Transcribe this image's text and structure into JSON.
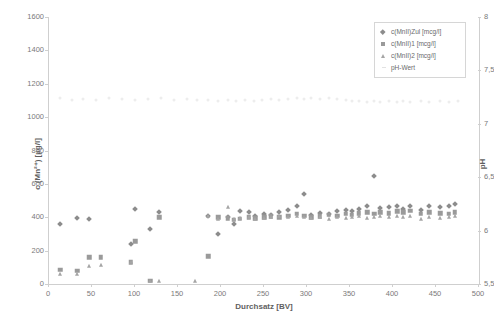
{
  "chart_data": {
    "type": "scatter",
    "title": "",
    "xlabel": "Durchsatz [BV]",
    "ylabel": "c (Mn2+) [µg/l]",
    "y2label": "pH",
    "xlim": [
      0,
      500
    ],
    "ylim": [
      0,
      1600
    ],
    "y2lim": [
      5.5,
      8
    ],
    "grid": false,
    "legend_position": "top-right",
    "xticks": [
      "0",
      "50",
      "100",
      "150",
      "200",
      "250",
      "300",
      "350",
      "400",
      "450",
      "500"
    ],
    "xtick_values": [
      0,
      50,
      100,
      150,
      200,
      250,
      300,
      350,
      400,
      450,
      500
    ],
    "yticks": [
      "0",
      "200",
      "400",
      "600",
      "800",
      "1000",
      "1200",
      "1400",
      "1600"
    ],
    "ytick_values": [
      0,
      200,
      400,
      600,
      800,
      1000,
      1200,
      1400,
      1600
    ],
    "y2ticks": [
      "5,5",
      "6",
      "6,5",
      "7",
      "7,5",
      "8"
    ],
    "y2tick_values": [
      5.5,
      6,
      6.5,
      7,
      7.5,
      8
    ],
    "series": [
      {
        "name": "c(MnII)Zul [mcg/l]",
        "marker": "diamond",
        "color": "#8c8c8c",
        "axis": "left",
        "points": [
          [
            13,
            360
          ],
          [
            33,
            395
          ],
          [
            47,
            390
          ],
          [
            95,
            240
          ],
          [
            100,
            450
          ],
          [
            118,
            330
          ],
          [
            128,
            430
          ],
          [
            185,
            410
          ],
          [
            197,
            300
          ],
          [
            208,
            400
          ],
          [
            215,
            360
          ],
          [
            222,
            440
          ],
          [
            232,
            430
          ],
          [
            240,
            410
          ],
          [
            250,
            420
          ],
          [
            258,
            415
          ],
          [
            268,
            430
          ],
          [
            278,
            445
          ],
          [
            288,
            470
          ],
          [
            297,
            540
          ],
          [
            305,
            415
          ],
          [
            315,
            425
          ],
          [
            325,
            420
          ],
          [
            335,
            435
          ],
          [
            345,
            445
          ],
          [
            352,
            440
          ],
          [
            360,
            450
          ],
          [
            370,
            470
          ],
          [
            378,
            650
          ],
          [
            385,
            455
          ],
          [
            395,
            460
          ],
          [
            405,
            470
          ],
          [
            412,
            450
          ],
          [
            420,
            465
          ],
          [
            432,
            445
          ],
          [
            442,
            470
          ],
          [
            455,
            460
          ],
          [
            465,
            470
          ],
          [
            472,
            480
          ]
        ]
      },
      {
        "name": "c(MnII)1 [mcg/l]",
        "marker": "square",
        "color": "#9a9a9a",
        "axis": "left",
        "points": [
          [
            13,
            85
          ],
          [
            33,
            80
          ],
          [
            47,
            160
          ],
          [
            60,
            160
          ],
          [
            95,
            130
          ],
          [
            100,
            255
          ],
          [
            118,
            20
          ],
          [
            128,
            400
          ],
          [
            185,
            165
          ],
          [
            197,
            400
          ],
          [
            208,
            395
          ],
          [
            215,
            385
          ],
          [
            222,
            390
          ],
          [
            232,
            400
          ],
          [
            240,
            395
          ],
          [
            250,
            400
          ],
          [
            258,
            405
          ],
          [
            268,
            400
          ],
          [
            278,
            410
          ],
          [
            288,
            420
          ],
          [
            297,
            410
          ],
          [
            305,
            400
          ],
          [
            315,
            405
          ],
          [
            325,
            415
          ],
          [
            335,
            410
          ],
          [
            345,
            420
          ],
          [
            352,
            415
          ],
          [
            360,
            425
          ],
          [
            370,
            430
          ],
          [
            378,
            420
          ],
          [
            385,
            430
          ],
          [
            395,
            425
          ],
          [
            405,
            435
          ],
          [
            412,
            430
          ],
          [
            420,
            440
          ],
          [
            432,
            420
          ],
          [
            442,
            430
          ],
          [
            455,
            425
          ],
          [
            465,
            420
          ],
          [
            472,
            430
          ]
        ]
      },
      {
        "name": "c(MnII)2 [mcg/l]",
        "marker": "triangle",
        "color": "#a5a5a5",
        "axis": "left",
        "points": [
          [
            13,
            60
          ],
          [
            33,
            60
          ],
          [
            47,
            110
          ],
          [
            60,
            115
          ],
          [
            95,
            130
          ],
          [
            118,
            15
          ],
          [
            128,
            20
          ],
          [
            170,
            20
          ],
          [
            185,
            405
          ],
          [
            197,
            390
          ],
          [
            208,
            460
          ],
          [
            215,
            390
          ],
          [
            222,
            395
          ],
          [
            232,
            400
          ],
          [
            240,
            390
          ],
          [
            250,
            395
          ],
          [
            258,
            400
          ],
          [
            268,
            405
          ],
          [
            278,
            400
          ],
          [
            288,
            410
          ],
          [
            297,
            400
          ],
          [
            305,
            395
          ],
          [
            315,
            400
          ],
          [
            325,
            390
          ],
          [
            335,
            400
          ],
          [
            345,
            395
          ],
          [
            352,
            400
          ],
          [
            360,
            405
          ],
          [
            370,
            395
          ],
          [
            378,
            400
          ],
          [
            385,
            405
          ],
          [
            395,
            400
          ],
          [
            405,
            410
          ],
          [
            412,
            400
          ],
          [
            420,
            405
          ],
          [
            432,
            390
          ],
          [
            442,
            400
          ],
          [
            455,
            395
          ],
          [
            465,
            400
          ],
          [
            472,
            405
          ]
        ]
      },
      {
        "name": "pH-Wert",
        "marker": "dot",
        "color": "#ededed",
        "axis": "right",
        "points": [
          [
            13,
            7.24
          ],
          [
            27,
            7.22
          ],
          [
            40,
            7.23
          ],
          [
            55,
            7.22
          ],
          [
            70,
            7.24
          ],
          [
            85,
            7.23
          ],
          [
            100,
            7.22
          ],
          [
            115,
            7.23
          ],
          [
            130,
            7.24
          ],
          [
            145,
            7.22
          ],
          [
            160,
            7.23
          ],
          [
            172,
            7.22
          ],
          [
            185,
            7.22
          ],
          [
            197,
            7.21
          ],
          [
            208,
            7.22
          ],
          [
            218,
            7.21
          ],
          [
            228,
            7.22
          ],
          [
            238,
            7.21
          ],
          [
            248,
            7.22
          ],
          [
            258,
            7.23
          ],
          [
            268,
            7.22
          ],
          [
            278,
            7.23
          ],
          [
            288,
            7.24
          ],
          [
            297,
            7.23
          ],
          [
            305,
            7.24
          ],
          [
            315,
            7.23
          ],
          [
            325,
            7.24
          ],
          [
            335,
            7.23
          ],
          [
            345,
            7.22
          ],
          [
            352,
            7.21
          ],
          [
            360,
            7.21
          ],
          [
            370,
            7.2
          ],
          [
            378,
            7.21
          ],
          [
            385,
            7.2
          ],
          [
            395,
            7.21
          ],
          [
            405,
            7.2
          ],
          [
            412,
            7.21
          ],
          [
            420,
            7.2
          ],
          [
            432,
            7.21
          ],
          [
            442,
            7.2
          ],
          [
            455,
            7.21
          ],
          [
            465,
            7.2
          ],
          [
            475,
            7.21
          ]
        ]
      }
    ]
  },
  "legend": {
    "items": [
      {
        "label": "c(MnII)Zul [mcg/l]",
        "marker": "diamond"
      },
      {
        "label": "c(MnII)1 [mcg/l]",
        "marker": "square"
      },
      {
        "label": "c(MnII)2 [mcg/l]",
        "marker": "triangle"
      },
      {
        "label": "pH-Wert",
        "marker": "dot"
      }
    ]
  },
  "axes": {
    "x_title": "Durchsatz [BV]",
    "y_title": "c (Mn²⁺) [µg/l]",
    "y2_title": "pH"
  }
}
